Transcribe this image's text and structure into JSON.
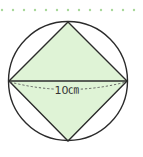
{
  "diagram": {
    "type": "geometry",
    "dimension_label": "10㎝",
    "colors": {
      "square_fill": "#dff3d6",
      "stroke": "#2b2b2b",
      "dots": "#a8d89a",
      "dashed": "#555555"
    },
    "circle": {
      "cx": 68,
      "cy": 81,
      "r": 59
    },
    "square_vertices": [
      [
        68,
        22
      ],
      [
        127,
        81
      ],
      [
        68,
        141
      ],
      [
        9,
        81
      ]
    ],
    "diameter": {
      "x1": 9,
      "y1": 81,
      "x2": 127,
      "y2": 81
    },
    "dotted_border": {
      "y": 10,
      "start_x": 2,
      "spacing": 11,
      "count": 13
    }
  }
}
